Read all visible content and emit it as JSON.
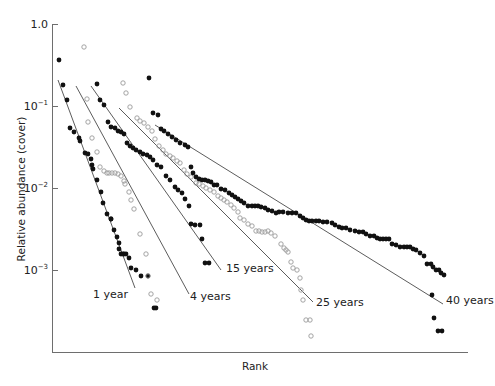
{
  "chart_data": {
    "type": "scatter",
    "title": "",
    "xlabel": "Rank",
    "ylabel": "Relative abundance (cover)",
    "yscale": "log",
    "ylim": [
      0.0001,
      1.0
    ],
    "yticks": [
      {
        "value": 1.0,
        "label": "1.0",
        "exp": ""
      },
      {
        "value": 0.1,
        "label": "10",
        "exp": "−1"
      },
      {
        "value": 0.01,
        "label": "10",
        "exp": "−2"
      },
      {
        "value": 0.001,
        "label": "10",
        "exp": "−3"
      }
    ],
    "grid": false,
    "legend": "inline labels at end of fitted lines",
    "series": [
      {
        "name": "1 year",
        "label": "1 year",
        "marker": "filled",
        "fit_line": {
          "px": [
            [
              58,
              80
            ],
            [
              135,
              288
            ]
          ]
        },
        "points_px": [
          [
            59,
            60
          ],
          [
            63,
            85
          ],
          [
            67,
            100
          ],
          [
            70,
            128
          ],
          [
            74,
            132
          ],
          [
            79,
            138
          ],
          [
            80,
            141
          ],
          [
            85,
            153
          ],
          [
            88,
            154
          ],
          [
            91,
            159
          ],
          [
            92,
            165
          ],
          [
            93,
            169
          ],
          [
            97,
            180
          ],
          [
            101,
            192
          ],
          [
            103,
            203
          ],
          [
            107,
            214
          ],
          [
            111,
            219
          ],
          [
            111,
            219
          ],
          [
            114,
            230
          ],
          [
            117,
            237
          ],
          [
            119,
            243
          ],
          [
            119,
            249
          ],
          [
            121,
            254
          ],
          [
            123,
            254
          ],
          [
            124,
            254
          ],
          [
            126,
            254
          ],
          [
            129,
            258
          ],
          [
            131,
            268
          ],
          [
            136,
            270
          ],
          [
            141,
            276
          ],
          [
            148,
            276
          ],
          [
            154,
            308
          ],
          [
            156,
            308
          ]
        ],
        "label_pos_px": [
          128,
          298
        ]
      },
      {
        "name": "4 years",
        "label": "4 years",
        "marker": "open",
        "fit_line": {
          "px": [
            [
              76,
              86
            ],
            [
              189,
              294
            ]
          ]
        },
        "points_px": [
          [
            84,
            47
          ],
          [
            87,
            99
          ],
          [
            88,
            122
          ],
          [
            92,
            138
          ],
          [
            97,
            152
          ],
          [
            100,
            167
          ],
          [
            104,
            171
          ],
          [
            107,
            173
          ],
          [
            109,
            173
          ],
          [
            112,
            173
          ],
          [
            115,
            173
          ],
          [
            118,
            174
          ],
          [
            121,
            176
          ],
          [
            124,
            181
          ],
          [
            125,
            184
          ],
          [
            129,
            192
          ],
          [
            131,
            200
          ],
          [
            134,
            209
          ],
          [
            140,
            234
          ],
          [
            146,
            254
          ],
          [
            148,
            276
          ],
          [
            151,
            294
          ],
          [
            157,
            300
          ]
        ],
        "label_pos_px": [
          190,
          300
        ]
      },
      {
        "name": "15 years",
        "label": "15 years",
        "marker": "filled",
        "fit_line": {
          "px": [
            [
              91,
              86
            ],
            [
              221,
              270
            ]
          ]
        },
        "points_px": [
          [
            97,
            84
          ],
          [
            100,
            100
          ],
          [
            104,
            105
          ],
          [
            108,
            122
          ],
          [
            111,
            127
          ],
          [
            115,
            128
          ],
          [
            118,
            131
          ],
          [
            121,
            132
          ],
          [
            124,
            134
          ],
          [
            127,
            143
          ],
          [
            130,
            146
          ],
          [
            133,
            148
          ],
          [
            136,
            150
          ],
          [
            140,
            152
          ],
          [
            143,
            154
          ],
          [
            147,
            155
          ],
          [
            150,
            157
          ],
          [
            153,
            160
          ],
          [
            157,
            165
          ],
          [
            161,
            167
          ],
          [
            166,
            176
          ],
          [
            170,
            180
          ],
          [
            175,
            187
          ],
          [
            178,
            190
          ],
          [
            182,
            193
          ],
          [
            185,
            199
          ],
          [
            189,
            206
          ],
          [
            191,
            224
          ],
          [
            195,
            225
          ],
          [
            200,
            225
          ],
          [
            202,
            239
          ],
          [
            205,
            263
          ],
          [
            209,
            263
          ]
        ],
        "label_pos_px": [
          226,
          272
        ]
      },
      {
        "name": "25 years",
        "label": "25 years",
        "marker": "open",
        "fit_line": {
          "px": [
            [
              119,
              108
            ],
            [
              313,
              302
            ]
          ]
        },
        "points_px": [
          [
            123,
            83
          ],
          [
            126,
            93
          ],
          [
            130,
            107
          ],
          [
            137,
            118
          ],
          [
            140,
            121
          ],
          [
            144,
            123
          ],
          [
            148,
            127
          ],
          [
            152,
            131
          ],
          [
            155,
            139
          ],
          [
            159,
            146
          ],
          [
            163,
            150
          ],
          [
            166,
            154
          ],
          [
            170,
            156
          ],
          [
            173,
            158
          ],
          [
            177,
            161
          ],
          [
            180,
            163
          ],
          [
            184,
            170
          ],
          [
            187,
            174
          ],
          [
            191,
            177
          ],
          [
            196,
            183
          ],
          [
            199,
            184
          ],
          [
            203,
            186
          ],
          [
            206,
            188
          ],
          [
            210,
            190
          ],
          [
            214,
            192
          ],
          [
            218,
            196
          ],
          [
            221,
            198
          ],
          [
            224,
            200
          ],
          [
            227,
            202
          ],
          [
            231,
            205
          ],
          [
            234,
            208
          ],
          [
            238,
            212
          ],
          [
            240,
            218
          ],
          [
            244,
            220
          ],
          [
            248,
            224
          ],
          [
            252,
            226
          ],
          [
            256,
            231
          ],
          [
            259,
            231
          ],
          [
            262,
            232
          ],
          [
            265,
            232
          ],
          [
            268,
            231
          ],
          [
            271,
            233
          ],
          [
            275,
            236
          ],
          [
            281,
            244
          ],
          [
            284,
            248
          ],
          [
            286,
            250
          ],
          [
            288,
            252
          ],
          [
            291,
            262
          ],
          [
            293,
            268
          ],
          [
            297,
            270
          ],
          [
            300,
            278
          ],
          [
            301,
            290
          ],
          [
            303,
            300
          ],
          [
            306,
            320
          ],
          [
            310,
            320
          ],
          [
            311,
            336
          ]
        ],
        "label_pos_px": [
          316,
          306
        ]
      },
      {
        "name": "40 years",
        "label": "40 years",
        "marker": "filled",
        "fit_line": {
          "px": [
            [
              155,
              125
            ],
            [
              443,
              304
            ]
          ]
        },
        "points_px": [
          [
            149,
            78
          ],
          [
            153,
            113
          ],
          [
            158,
            115
          ],
          [
            161,
            129
          ],
          [
            164,
            131
          ],
          [
            168,
            134
          ],
          [
            172,
            137
          ],
          [
            176,
            140
          ],
          [
            180,
            143
          ],
          [
            185,
            145
          ],
          [
            188,
            147
          ],
          [
            191,
            167
          ],
          [
            193,
            173
          ],
          [
            196,
            177
          ],
          [
            199,
            179
          ],
          [
            202,
            180
          ],
          [
            205,
            180
          ],
          [
            208,
            181
          ],
          [
            211,
            182
          ],
          [
            214,
            185
          ],
          [
            217,
            185
          ],
          [
            221,
            189
          ],
          [
            225,
            190
          ],
          [
            229,
            193
          ],
          [
            232,
            195
          ],
          [
            235,
            197
          ],
          [
            238,
            199
          ],
          [
            241,
            201
          ],
          [
            244,
            203
          ],
          [
            248,
            206
          ],
          [
            252,
            206
          ],
          [
            255,
            206
          ],
          [
            258,
            206
          ],
          [
            261,
            207
          ],
          [
            265,
            208
          ],
          [
            268,
            210
          ],
          [
            272,
            211
          ],
          [
            276,
            213
          ],
          [
            279,
            212
          ],
          [
            283,
            212
          ],
          [
            288,
            213
          ],
          [
            292,
            213
          ],
          [
            296,
            213
          ],
          [
            300,
            216
          ],
          [
            303,
            218
          ],
          [
            306,
            220
          ],
          [
            309,
            221
          ],
          [
            312,
            221
          ],
          [
            316,
            221
          ],
          [
            319,
            221
          ],
          [
            323,
            222
          ],
          [
            327,
            222
          ],
          [
            332,
            223
          ],
          [
            335,
            225
          ],
          [
            339,
            227
          ],
          [
            342,
            228
          ],
          [
            346,
            228
          ],
          [
            350,
            230
          ],
          [
            355,
            231
          ],
          [
            359,
            232
          ],
          [
            363,
            232
          ],
          [
            366,
            234
          ],
          [
            370,
            236
          ],
          [
            374,
            236
          ],
          [
            377,
            238
          ],
          [
            380,
            239
          ],
          [
            383,
            239
          ],
          [
            386,
            239
          ],
          [
            389,
            239
          ],
          [
            392,
            244
          ],
          [
            396,
            245
          ],
          [
            400,
            247
          ],
          [
            404,
            247
          ],
          [
            407,
            247
          ],
          [
            410,
            247
          ],
          [
            413,
            249
          ],
          [
            416,
            250
          ],
          [
            420,
            253
          ],
          [
            424,
            256
          ],
          [
            427,
            264
          ],
          [
            431,
            264
          ],
          [
            433,
            267
          ],
          [
            436,
            270
          ],
          [
            439,
            270
          ],
          [
            441,
            273
          ],
          [
            444,
            275
          ],
          [
            432,
            295
          ],
          [
            434,
            318
          ],
          [
            438,
            331
          ],
          [
            442,
            331
          ]
        ],
        "label_pos_px": [
          446,
          304
        ]
      }
    ],
    "axis_px": {
      "x0": 52,
      "y_top": 24,
      "y_bottom": 353,
      "x_end": 468,
      "y_tick_px": {
        "1.0": 24,
        "1e-1": 106,
        "1e-2": 188,
        "1e-3": 270
      }
    }
  }
}
